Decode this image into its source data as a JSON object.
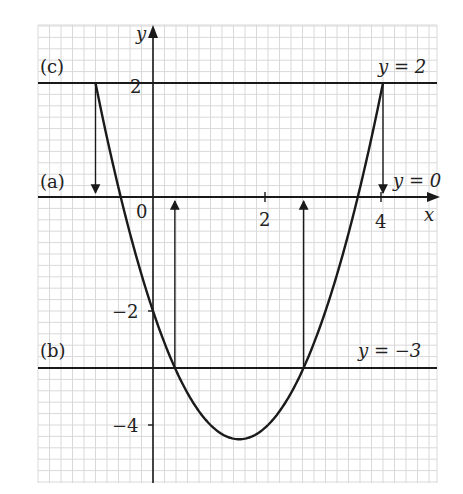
{
  "chart_data": {
    "type": "line",
    "title": "",
    "xlabel": "x",
    "ylabel": "y",
    "xlim": [
      -2,
      4.95
    ],
    "ylim": [
      -5,
      3
    ],
    "grid": true,
    "grid_minor_step": 0.2,
    "curve": {
      "name": "y = x^2 - 3x - 2",
      "coefficients": {
        "a": 1,
        "b": -3,
        "c": -2
      },
      "x_range": [
        -1,
        4
      ],
      "vertex": [
        1.5,
        -4.25
      ]
    },
    "horizontal_lines": [
      {
        "id": "c",
        "label": "(c)",
        "equation": "y = 2",
        "y": 2
      },
      {
        "id": "a",
        "label": "(a)",
        "equation": "y = 0",
        "y": 0
      },
      {
        "id": "b",
        "label": "(b)",
        "equation": "y = −3",
        "y": -3
      }
    ],
    "arrows": [
      {
        "x": -1,
        "from_y": 2,
        "to_y": 0
      },
      {
        "x": 4,
        "from_y": 2,
        "to_y": 0
      },
      {
        "x": 0.38,
        "from_y": -3,
        "to_y": 0
      },
      {
        "x": 2.62,
        "from_y": -3,
        "to_y": 0
      }
    ],
    "x_ticks": [
      {
        "v": 0,
        "label": "0"
      },
      {
        "v": 2,
        "label": "2"
      },
      {
        "v": 4,
        "label": "4"
      }
    ],
    "y_ticks": [
      {
        "v": 2,
        "label": "2"
      },
      {
        "v": -2,
        "label": "−2"
      },
      {
        "v": -4,
        "label": "−4"
      }
    ]
  },
  "labels": {
    "x_axis": "x",
    "y_axis": "y",
    "origin": "0",
    "x_tick_2": "2",
    "x_tick_4": "4",
    "y_tick_2": "2",
    "y_tick_m2": "−2",
    "y_tick_m4": "−4",
    "line_c_tag": "(c)",
    "line_a_tag": "(a)",
    "line_b_tag": "(b)",
    "line_c_eq": "y = 2",
    "line_a_eq": "y = 0",
    "line_b_eq": "y = −3"
  },
  "colors": {
    "grid": "#d9d9d9",
    "ink": "#1a1a1a",
    "background": "#ffffff"
  }
}
